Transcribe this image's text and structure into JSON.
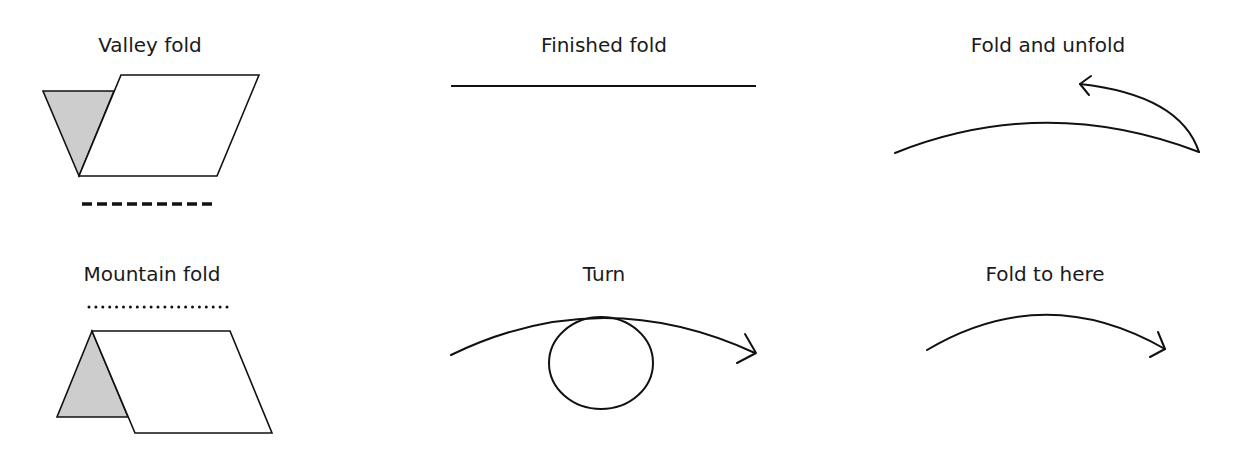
{
  "legend": {
    "valley_fold": {
      "label": "Valley fold",
      "line_style": "dashed"
    },
    "mountain_fold": {
      "label": "Mountain fold",
      "line_style": "dotted"
    },
    "finished_fold": {
      "label": "Finished fold",
      "line_style": "solid"
    },
    "turn": {
      "label": "Turn"
    },
    "fold_and_unfold": {
      "label": "Fold and unfold"
    },
    "fold_to_here": {
      "label": "Fold to here"
    }
  },
  "colors": {
    "line": "#111111",
    "shade": "#cdcdcd",
    "background": "#ffffff"
  }
}
